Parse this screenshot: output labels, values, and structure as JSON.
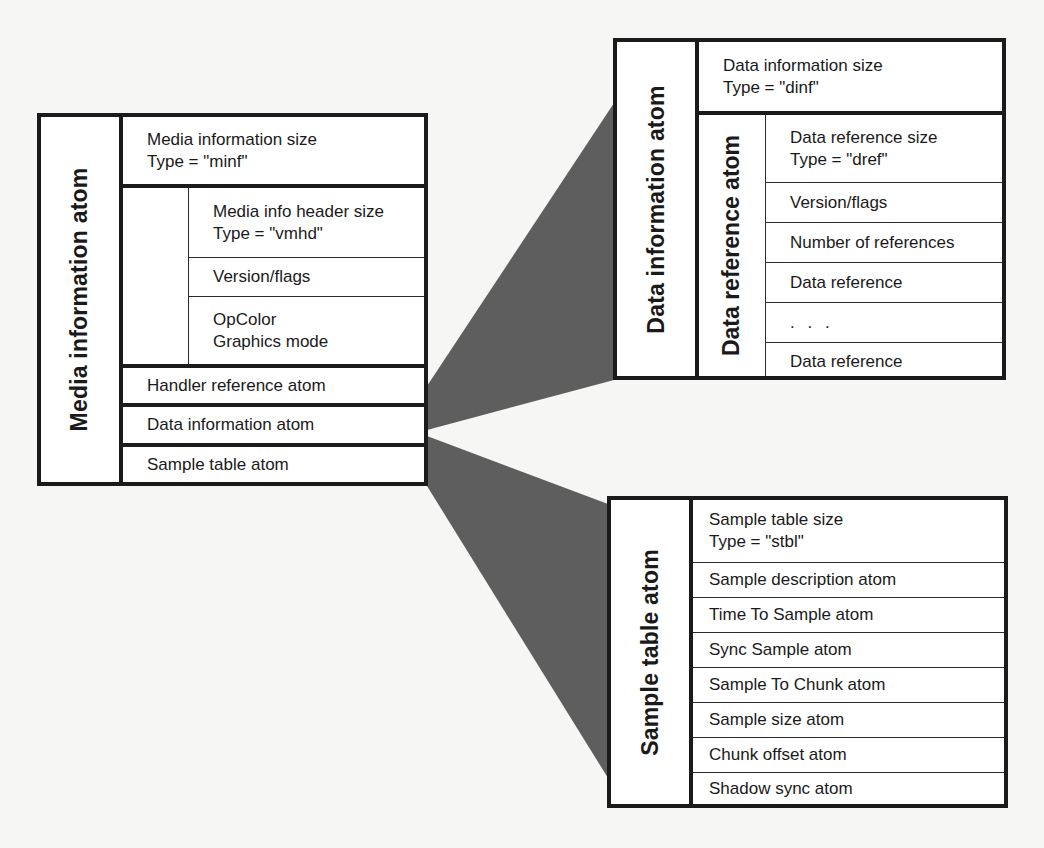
{
  "colors": {
    "background": "#f6f6f4",
    "box_fill": "#ffffff",
    "border": "#1b1b1b",
    "wedge": "#5e5e5e"
  },
  "media_information_atom": {
    "label": "Media information atom",
    "header": {
      "line1": "Media information size",
      "line2": "Type = \"minf\""
    },
    "video_media_header": {
      "rows": [
        {
          "line1": "Media info header size",
          "line2": "Type = \"vmhd\""
        },
        {
          "line1": "Version/flags"
        },
        {
          "line1": "OpColor",
          "line2": "Graphics mode"
        }
      ]
    },
    "child_atoms": [
      {
        "label": "Handler reference atom"
      },
      {
        "label": "Data information atom"
      },
      {
        "label": "Sample table atom"
      }
    ]
  },
  "data_information_atom": {
    "label": "Data information atom",
    "header": {
      "line1": "Data information size",
      "line2": "Type = \"dinf\""
    },
    "data_reference_atom": {
      "label": "Data reference atom",
      "rows": [
        {
          "line1": "Data reference size",
          "line2": "Type = \"dref\""
        },
        {
          "line1": "Version/flags"
        },
        {
          "line1": "Number of references"
        },
        {
          "line1": "Data reference"
        },
        {
          "line1": ". . ."
        },
        {
          "line1": "Data reference"
        }
      ]
    }
  },
  "sample_table_atom": {
    "label": "Sample table atom",
    "rows": [
      {
        "line1": "Sample table size",
        "line2": "Type = \"stbl\""
      },
      {
        "line1": "Sample description atom"
      },
      {
        "line1": "Time To Sample atom"
      },
      {
        "line1": "Sync Sample atom"
      },
      {
        "line1": "Sample To Chunk atom"
      },
      {
        "line1": "Sample size atom"
      },
      {
        "line1": "Chunk offset atom"
      },
      {
        "line1": "Shadow sync atom"
      }
    ]
  },
  "connectors": [
    {
      "from": "Data information atom",
      "to": "Data information atom (expanded)"
    },
    {
      "from": "Sample table atom",
      "to": "Sample table atom (expanded)"
    }
  ]
}
